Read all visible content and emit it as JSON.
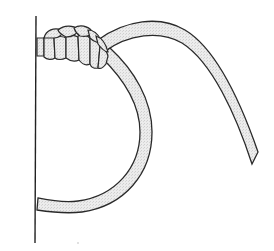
{
  "figure": {
    "title": "Knot tied to a vertical spar",
    "description": "Line drawing of a rope hitched around a vertical pole with wrapped turns at the top, a loop curving down and back to the pole, and a long free end sweeping to the right.",
    "colors": {
      "outline": "#2a2a2a",
      "rope_fill": "#e4e4e4",
      "background": "#ffffff"
    },
    "parts": {
      "pole": "vertical pole",
      "wraps": "wrapped turns",
      "loop": "rope loop",
      "tail": "free end"
    }
  }
}
